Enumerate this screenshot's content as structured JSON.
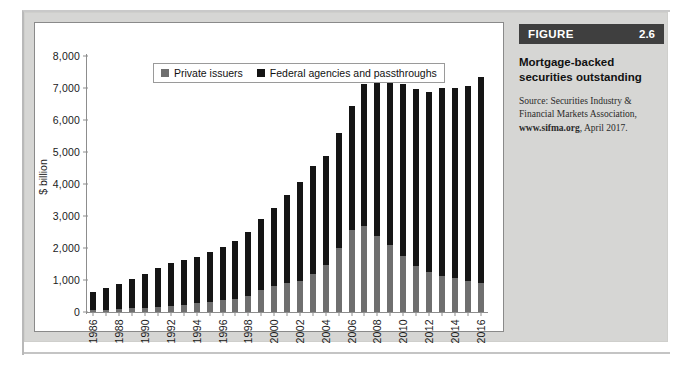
{
  "figure": {
    "label": "FIGURE",
    "number": "2.6",
    "title": "Mortgage-backed securities outstanding",
    "source_prefix": "Source: Securities Industry & Financial Markets Association, ",
    "source_link": "www.sifma.org",
    "source_suffix": ", April 2017."
  },
  "chart_data": {
    "type": "bar",
    "stacked": true,
    "title": "Mortgage-backed securities outstanding",
    "xlabel": "",
    "ylabel": "$ billion",
    "ylim": [
      0,
      8000
    ],
    "ytick_step": 1000,
    "yticks": [
      "0",
      "1,000",
      "2,000",
      "3,000",
      "4,000",
      "5,000",
      "6,000",
      "7,000",
      "8,000"
    ],
    "grid": false,
    "legend_position": "top-left-inside",
    "categories": [
      "1986",
      "1987",
      "1988",
      "1989",
      "1990",
      "1991",
      "1992",
      "1993",
      "1994",
      "1995",
      "1996",
      "1997",
      "1998",
      "1999",
      "2000",
      "2001",
      "2002",
      "2003",
      "2004",
      "2005",
      "2006",
      "2007",
      "2008",
      "2009",
      "2010",
      "2011",
      "2012",
      "2013",
      "2014",
      "2015",
      "2016"
    ],
    "xtick_labels": [
      "1986",
      "",
      "1988",
      "",
      "1990",
      "",
      "1992",
      "",
      "1994",
      "",
      "1996",
      "",
      "1998",
      "",
      "2000",
      "",
      "2002",
      "",
      "2004",
      "",
      "2006",
      "",
      "2008",
      "",
      "2010",
      "",
      "2012",
      "",
      "2014",
      "",
      "2016"
    ],
    "series": [
      {
        "name": "Private issuers",
        "color": "#6f6f6f",
        "values": [
          50,
          70,
          90,
          110,
          140,
          170,
          200,
          230,
          270,
          310,
          360,
          420,
          500,
          680,
          800,
          900,
          970,
          1180,
          1480,
          2000,
          2560,
          2700,
          2370,
          2100,
          1760,
          1450,
          1260,
          1130,
          1060,
          970,
          900
        ]
      },
      {
        "name": "Federal agencies and passthroughs",
        "color": "#141414",
        "values": [
          570,
          690,
          790,
          930,
          1060,
          1210,
          1320,
          1380,
          1460,
          1560,
          1670,
          1790,
          1990,
          2230,
          2440,
          2750,
          3100,
          3390,
          3410,
          3580,
          3890,
          4440,
          4940,
          5200,
          5360,
          5530,
          5630,
          5870,
          5940,
          6100,
          6460
        ]
      }
    ],
    "totals": [
      620,
      760,
      880,
      1040,
      1200,
      1380,
      1520,
      1610,
      1730,
      1870,
      2030,
      2210,
      2490,
      2910,
      3240,
      3650,
      4070,
      4570,
      4890,
      5580,
      6450,
      7140,
      7310,
      7300,
      7120,
      6980,
      6890,
      7000,
      7000,
      7070,
      7360
    ]
  },
  "legend": {
    "items": [
      {
        "label": "Private issuers",
        "color": "#6f6f6f"
      },
      {
        "label": "Federal agencies and passthroughs",
        "color": "#141414"
      }
    ]
  }
}
